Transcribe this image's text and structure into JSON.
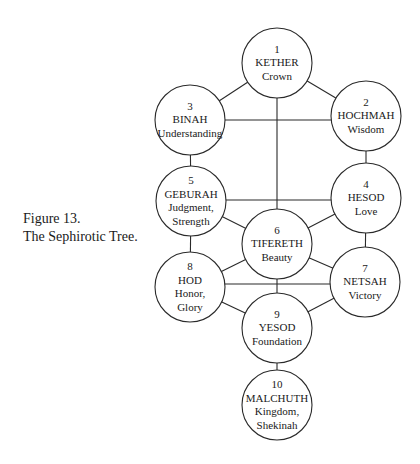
{
  "caption": {
    "line1": "Figure 13.",
    "line2": "The Sephirotic Tree."
  },
  "style": {
    "stroke": "#2a2a2a",
    "fill": "#ffffff",
    "radius": 35
  },
  "nodes": [
    {
      "id": "kether",
      "number": "1",
      "name": "KETHER",
      "meaning": [
        "Crown"
      ],
      "cx": 277,
      "cy": 63
    },
    {
      "id": "hochmah",
      "number": "2",
      "name": "HOCHMAH",
      "meaning": [
        "Wisdom"
      ],
      "cx": 366,
      "cy": 116
    },
    {
      "id": "binah",
      "number": "3",
      "name": "BINAH",
      "meaning": [
        "Understanding"
      ],
      "cx": 190,
      "cy": 120
    },
    {
      "id": "hesod",
      "number": "4",
      "name": "HESOD",
      "meaning": [
        "Love"
      ],
      "cx": 366,
      "cy": 198
    },
    {
      "id": "geburah",
      "number": "5",
      "name": "GEBURAH",
      "meaning": [
        "Judgment,",
        "Strength"
      ],
      "cx": 191,
      "cy": 201
    },
    {
      "id": "tifereth",
      "number": "6",
      "name": "TIFERETH",
      "meaning": [
        "Beauty"
      ],
      "cx": 277,
      "cy": 244
    },
    {
      "id": "netsah",
      "number": "7",
      "name": "NETSAH",
      "meaning": [
        "Victory"
      ],
      "cx": 365,
      "cy": 282
    },
    {
      "id": "hod",
      "number": "8",
      "name": "HOD",
      "meaning": [
        "Honor,",
        "Glory"
      ],
      "cx": 190,
      "cy": 287
    },
    {
      "id": "yesod",
      "number": "9",
      "name": "YESOD",
      "meaning": [
        "Foundation"
      ],
      "cx": 277,
      "cy": 328
    },
    {
      "id": "malchuth",
      "number": "10",
      "name": "MALCHUTH",
      "meaning": [
        "Kingdom,",
        "Shekinah"
      ],
      "cx": 277,
      "cy": 405
    }
  ],
  "paths": [
    {
      "from": "kether",
      "to": "binah"
    },
    {
      "from": "kether",
      "to": "hochmah"
    },
    {
      "from": "binah",
      "to": "hochmah",
      "horizontal_y": 120
    },
    {
      "from": "kether",
      "to": "tifereth"
    },
    {
      "from": "binah",
      "to": "geburah"
    },
    {
      "from": "hochmah",
      "to": "hesod"
    },
    {
      "from": "geburah",
      "to": "hesod",
      "horizontal_y": 200
    },
    {
      "from": "geburah",
      "to": "tifereth"
    },
    {
      "from": "hesod",
      "to": "tifereth"
    },
    {
      "from": "geburah",
      "to": "hod"
    },
    {
      "from": "hesod",
      "to": "netsah"
    },
    {
      "from": "tifereth",
      "to": "hod"
    },
    {
      "from": "tifereth",
      "to": "netsah"
    },
    {
      "from": "hod",
      "to": "netsah",
      "horizontal_y": 284
    },
    {
      "from": "tifereth",
      "to": "yesod"
    },
    {
      "from": "hod",
      "to": "yesod"
    },
    {
      "from": "netsah",
      "to": "yesod"
    },
    {
      "from": "yesod",
      "to": "malchuth"
    }
  ]
}
